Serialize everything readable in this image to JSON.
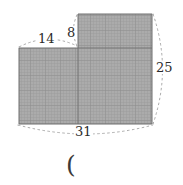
{
  "figure": {
    "kind": "shaded-polygon-with-dimensions",
    "caption_symbol": "(",
    "fill_color": "#a9a9a9",
    "hatch_color": "#8f8f8f",
    "outline_color": "#6e6e6e",
    "dimension_line_color": "#9a9a9a",
    "label_color": "#2b2b2b",
    "background_color": "#ffffff",
    "dimensions": [
      {
        "id": "top-left-width",
        "value": "14",
        "edge": "top-left-horizontal"
      },
      {
        "id": "notch-height",
        "value": "8",
        "edge": "notch-vertical"
      },
      {
        "id": "right-height",
        "value": "25",
        "edge": "right-vertical"
      },
      {
        "id": "bottom-width",
        "value": "31",
        "edge": "bottom-horizontal"
      }
    ],
    "shape": {
      "description": "L-shaped (step) polygon, shaded with fine cross-hatch grid",
      "vertices": [
        [
          19,
          48
        ],
        [
          78,
          48
        ],
        [
          78,
          14
        ],
        [
          152,
          14
        ],
        [
          152,
          124
        ],
        [
          19,
          124
        ]
      ],
      "interior_lines": [
        {
          "from": [
            78,
            48
          ],
          "to": [
            78,
            124
          ],
          "orientation": "vertical"
        },
        {
          "from": [
            78,
            48
          ],
          "to": [
            152,
            48
          ],
          "orientation": "horizontal"
        }
      ]
    }
  }
}
